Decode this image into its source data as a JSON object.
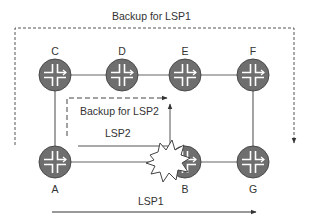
{
  "diagram": {
    "type": "network-topology",
    "nodes": [
      {
        "id": "C",
        "label": "C",
        "x": 55,
        "y": 75
      },
      {
        "id": "D",
        "label": "D",
        "x": 122,
        "y": 75
      },
      {
        "id": "E",
        "label": "E",
        "x": 185,
        "y": 75
      },
      {
        "id": "F",
        "label": "F",
        "x": 253,
        "y": 75
      },
      {
        "id": "A",
        "label": "A",
        "x": 55,
        "y": 162
      },
      {
        "id": "B",
        "label": "B",
        "x": 185,
        "y": 162
      },
      {
        "id": "G",
        "label": "G",
        "x": 253,
        "y": 162
      }
    ],
    "links": [
      [
        "C",
        "D"
      ],
      [
        "D",
        "E"
      ],
      [
        "E",
        "F"
      ],
      [
        "C",
        "A"
      ],
      [
        "F",
        "G"
      ],
      [
        "A",
        "B"
      ],
      [
        "B",
        "G"
      ]
    ],
    "failure": {
      "near": "B",
      "description": "link failure starburst between A and B"
    },
    "paths": {
      "backup_lsp1": {
        "label": "Backup for LSP1",
        "style": "dashed"
      },
      "backup_lsp2": {
        "label": "Backup for LSP2",
        "style": "dashed"
      },
      "lsp2": {
        "label": "LSP2",
        "style": "solid"
      },
      "lsp1": {
        "label": "LSP1",
        "style": "solid"
      }
    },
    "colors": {
      "router_fill": "#6e6e6e",
      "router_edge": "#555555",
      "router_glyph": "#ffffff",
      "line": "#555555",
      "text": "#333333"
    }
  }
}
